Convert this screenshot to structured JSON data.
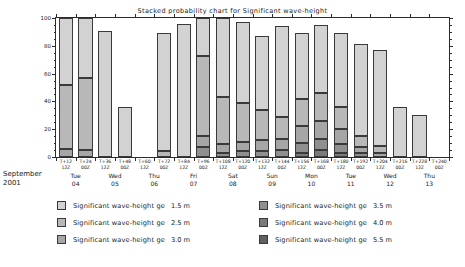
{
  "chart_data": {
    "type": "bar",
    "stacked": true,
    "title": "Stacked probability chart for Significant wave-height",
    "xlabel": "",
    "ylabel": "",
    "ylim": [
      0,
      100
    ],
    "yticks": [
      0,
      20,
      40,
      60,
      80,
      100
    ],
    "ytick_labels": [
      "0",
      "20",
      "40",
      "60",
      "80",
      "100"
    ],
    "grid": false,
    "legend_position": "bottom",
    "month_label": "September\n2001",
    "month_line1": "September",
    "month_line2": "2001",
    "categories": [
      "T+12",
      "T+24",
      "T+36",
      "T+48",
      "T+60",
      "T+72",
      "T+84",
      "T+96",
      "T+108",
      "T+120",
      "T+132",
      "T+144",
      "T+156",
      "T+168",
      "T+180",
      "T+192",
      "T+204",
      "T+216",
      "T+228",
      "T+240"
    ],
    "hour_labels": [
      "12Z",
      "00Z",
      "12Z",
      "00Z",
      "12Z",
      "00Z",
      "12Z",
      "00Z",
      "12Z",
      "00Z",
      "12Z",
      "00Z",
      "12Z",
      "00Z",
      "12Z",
      "00Z",
      "12Z",
      "00Z",
      "12Z",
      "00Z"
    ],
    "tick_hour_row": [
      "00Z",
      "12Z",
      "00Z",
      "12Z",
      "00Z",
      "12Z",
      "00Z",
      "12Z",
      "00Z",
      "12Z",
      "00Z",
      "12Z",
      "00Z",
      "12Z",
      "00Z",
      "12Z",
      "00Z",
      "12Z",
      "00Z",
      "12Z"
    ],
    "days": [
      {
        "name": "Tue",
        "num": "04"
      },
      {
        "name": "Wed",
        "num": "05"
      },
      {
        "name": "Thu",
        "num": "06"
      },
      {
        "name": "Fri",
        "num": "07"
      },
      {
        "name": "Sat",
        "num": "08"
      },
      {
        "name": "Sun",
        "num": "09"
      },
      {
        "name": "Mon",
        "num": "10"
      },
      {
        "name": "Tue",
        "num": "11"
      },
      {
        "name": "Wed",
        "num": "12"
      },
      {
        "name": "Thu",
        "num": "13"
      }
    ],
    "series": [
      {
        "name": "Significant wave-height ge 1.5 m",
        "threshold": "1.5 m",
        "color": "#d2d2d2",
        "values": [
          100,
          100,
          91,
          0,
          89,
          96,
          100,
          97,
          87,
          94,
          89,
          95,
          89,
          81,
          77,
          0,
          0,
          0,
          0,
          0
        ]
      },
      {
        "name": "Significant wave-height ge 2.5 m",
        "threshold": "2.5 m",
        "color": "#b8b8b8",
        "values": [
          52,
          57,
          0,
          36,
          0,
          0,
          72,
          43,
          34,
          29,
          42,
          36,
          41,
          19,
          16,
          0,
          0,
          0,
          0,
          0
        ]
      },
      {
        "name": "Significant wave-height ge 3.0 m",
        "threshold": "3.0 m",
        "color": "#a6a6a6",
        "values": [
          6,
          14,
          0,
          3,
          0,
          0,
          48,
          32,
          24,
          20,
          31,
          27,
          28,
          11,
          9,
          0,
          0,
          0,
          0,
          0
        ]
      },
      {
        "name": "Significant wave-height ge 3.5 m",
        "threshold": "3.5 m",
        "color": "#8f8f8f",
        "values": [
          0,
          3,
          0,
          0,
          0,
          0,
          31,
          21,
          15,
          13,
          22,
          18,
          18,
          6,
          5,
          0,
          0,
          0,
          0,
          0
        ]
      },
      {
        "name": "Significant wave-height ge 4.0 m",
        "threshold": "4.0 m",
        "color": "#7a7a7a",
        "values": [
          0,
          0,
          0,
          0,
          0,
          0,
          17,
          12,
          8,
          7,
          13,
          10,
          9,
          3,
          2,
          0,
          0,
          0,
          0,
          0
        ]
      },
      {
        "name": "Significant wave-height ge 5.5 m",
        "threshold": "5.5 m",
        "color": "#606060",
        "values": [
          0,
          0,
          0,
          0,
          0,
          0,
          4,
          3,
          2,
          1,
          3,
          2,
          2,
          1,
          0,
          0,
          0,
          0,
          0,
          0
        ]
      }
    ],
    "bars": [
      {
        "x": "T+12",
        "segments": [
          {
            "t": "1.5 m",
            "top": 100,
            "bottom": 52
          },
          {
            "t": "2.5 m",
            "top": 52,
            "bottom": 6
          },
          {
            "t": "3.0 m",
            "top": 6,
            "bottom": 0
          }
        ]
      },
      {
        "x": "T+24",
        "segments": [
          {
            "t": "1.5 m",
            "top": 100,
            "bottom": 57
          },
          {
            "t": "2.5 m",
            "top": 57,
            "bottom": 5
          },
          {
            "t": "3.0 m",
            "top": 5,
            "bottom": 0
          }
        ]
      },
      {
        "x": "T+36",
        "segments": [
          {
            "t": "1.5 m",
            "top": 91,
            "bottom": 0
          }
        ]
      },
      {
        "x": "T+48",
        "segments": [
          {
            "t": "1.5 m",
            "top": 36,
            "bottom": 0
          }
        ]
      },
      {
        "x": "T+60",
        "segments": []
      },
      {
        "x": "T+72",
        "segments": [
          {
            "t": "1.5 m",
            "top": 89,
            "bottom": 4
          },
          {
            "t": "2.5 m",
            "top": 4,
            "bottom": 0
          }
        ]
      },
      {
        "x": "T+84",
        "segments": [
          {
            "t": "1.5 m",
            "top": 96,
            "bottom": 0
          }
        ]
      },
      {
        "x": "T+96",
        "segments": [
          {
            "t": "1.5 m",
            "top": 100,
            "bottom": 73
          },
          {
            "t": "2.5 m",
            "top": 73,
            "bottom": 15
          },
          {
            "t": "3.0 m",
            "top": 15,
            "bottom": 7
          },
          {
            "t": "3.5 m",
            "top": 7,
            "bottom": 0
          }
        ]
      },
      {
        "x": "T+108",
        "segments": [
          {
            "t": "1.5 m",
            "top": 100,
            "bottom": 43
          },
          {
            "t": "2.5 m",
            "top": 43,
            "bottom": 9
          },
          {
            "t": "3.0 m",
            "top": 9,
            "bottom": 3
          },
          {
            "t": "3.5 m",
            "top": 3,
            "bottom": 0
          }
        ]
      },
      {
        "x": "T+120",
        "segments": [
          {
            "t": "1.5 m",
            "top": 97,
            "bottom": 39
          },
          {
            "t": "2.5 m",
            "top": 39,
            "bottom": 11
          },
          {
            "t": "3.0 m",
            "top": 11,
            "bottom": 4
          },
          {
            "t": "3.5 m",
            "top": 4,
            "bottom": 0
          }
        ]
      },
      {
        "x": "T+132",
        "segments": [
          {
            "t": "1.5 m",
            "top": 87,
            "bottom": 34
          },
          {
            "t": "2.5 m",
            "top": 34,
            "bottom": 12
          },
          {
            "t": "3.0 m",
            "top": 12,
            "bottom": 4
          },
          {
            "t": "3.5 m",
            "top": 4,
            "bottom": 0
          }
        ]
      },
      {
        "x": "T+144",
        "segments": [
          {
            "t": "1.5 m",
            "top": 94,
            "bottom": 29
          },
          {
            "t": "2.5 m",
            "top": 29,
            "bottom": 13
          },
          {
            "t": "3.0 m",
            "top": 13,
            "bottom": 5
          },
          {
            "t": "3.5 m",
            "top": 5,
            "bottom": 0
          }
        ]
      },
      {
        "x": "T+156",
        "segments": [
          {
            "t": "1.5 m",
            "top": 89,
            "bottom": 42
          },
          {
            "t": "2.5 m",
            "top": 42,
            "bottom": 22
          },
          {
            "t": "3.0 m",
            "top": 22,
            "bottom": 10
          },
          {
            "t": "3.5 m",
            "top": 10,
            "bottom": 3
          },
          {
            "t": "4.0 m",
            "top": 3,
            "bottom": 0
          }
        ]
      },
      {
        "x": "T+168",
        "segments": [
          {
            "t": "1.5 m",
            "top": 95,
            "bottom": 46
          },
          {
            "t": "2.5 m",
            "top": 46,
            "bottom": 26
          },
          {
            "t": "3.0 m",
            "top": 26,
            "bottom": 13
          },
          {
            "t": "3.5 m",
            "top": 13,
            "bottom": 5
          },
          {
            "t": "4.0 m",
            "top": 5,
            "bottom": 0
          }
        ]
      },
      {
        "x": "T+180",
        "segments": [
          {
            "t": "1.5 m",
            "top": 89,
            "bottom": 36
          },
          {
            "t": "2.5 m",
            "top": 36,
            "bottom": 20
          },
          {
            "t": "3.0 m",
            "top": 20,
            "bottom": 9
          },
          {
            "t": "3.5 m",
            "top": 9,
            "bottom": 3
          },
          {
            "t": "4.0 m",
            "top": 3,
            "bottom": 0
          }
        ]
      },
      {
        "x": "T+192",
        "segments": [
          {
            "t": "1.5 m",
            "top": 81,
            "bottom": 15
          },
          {
            "t": "2.5 m",
            "top": 15,
            "bottom": 7
          },
          {
            "t": "3.0 m",
            "top": 7,
            "bottom": 3
          },
          {
            "t": "3.5 m",
            "top": 3,
            "bottom": 0
          }
        ]
      },
      {
        "x": "T+204",
        "segments": [
          {
            "t": "1.5 m",
            "top": 77,
            "bottom": 8
          },
          {
            "t": "2.5 m",
            "top": 8,
            "bottom": 3
          },
          {
            "t": "3.0 m",
            "top": 3,
            "bottom": 0
          }
        ]
      },
      {
        "x": "T+216",
        "segments": [
          {
            "t": "1.5 m",
            "top": 36,
            "bottom": 0
          }
        ]
      },
      {
        "x": "T+228",
        "segments": [
          {
            "t": "1.5 m",
            "top": 30,
            "bottom": 0
          }
        ]
      },
      {
        "x": "T+240",
        "segments": []
      }
    ]
  }
}
